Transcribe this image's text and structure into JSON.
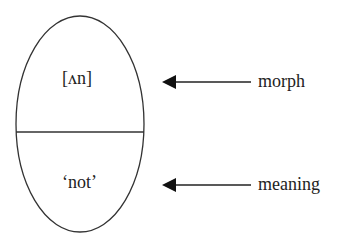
{
  "diagram": {
    "shape": "ellipse",
    "top_section": {
      "text": "[ʌn]"
    },
    "bottom_section": {
      "text": "‘not’"
    },
    "arrows": [
      {
        "label": "morph",
        "points_to": "top_section"
      },
      {
        "label": "meaning",
        "points_to": "bottom_section"
      }
    ],
    "colors": {
      "stroke": "#333333",
      "text": "#222222",
      "background": "#ffffff"
    }
  }
}
